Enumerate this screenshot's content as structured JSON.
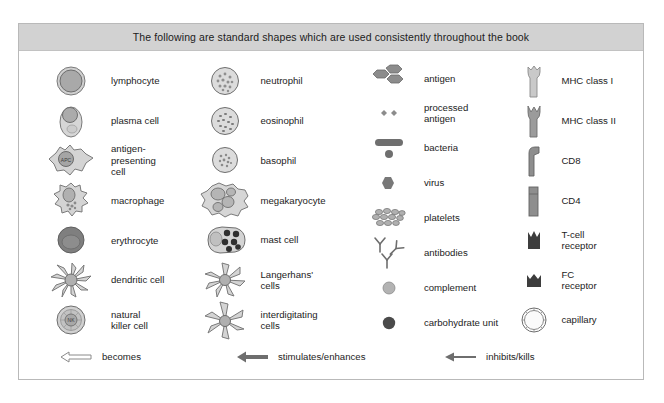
{
  "figure": {
    "header_title": "The following are standard shapes which are used consistently throughout the book",
    "colors": {
      "header_band": "#d2d2d2",
      "border": "#b9b9b9",
      "cell_fill_light": "#d8d8d8",
      "cell_fill_mid": "#b5b5b5",
      "cell_fill_dark": "#7d7d7d",
      "cell_fill_darkest": "#4a4a4a",
      "outline": "#6e6e6e",
      "text": "#1c1c1c"
    }
  },
  "columns": [
    {
      "id": "column-cells-1",
      "items": [
        {
          "icon": "lymphocyte-icon",
          "label": "lymphocyte"
        },
        {
          "icon": "plasma-cell-icon",
          "label": "plasma cell"
        },
        {
          "icon": "antigen-presenting-cell-icon",
          "label": "antigen-\npresenting\ncell",
          "inner_text": "APC"
        },
        {
          "icon": "macrophage-icon",
          "label": "macrophage"
        },
        {
          "icon": "erythrocyte-icon",
          "label": "erythrocyte"
        },
        {
          "icon": "dendritic-cell-icon",
          "label": "dendritic cell"
        },
        {
          "icon": "natural-killer-cell-icon",
          "label": "natural\nkiller cell",
          "inner_text": "NK"
        }
      ]
    },
    {
      "id": "column-cells-2",
      "items": [
        {
          "icon": "neutrophil-icon",
          "label": "neutrophil"
        },
        {
          "icon": "eosinophil-icon",
          "label": "eosinophil"
        },
        {
          "icon": "basophil-icon",
          "label": "basophil"
        },
        {
          "icon": "megakaryocyte-icon",
          "label": "megakaryocyte"
        },
        {
          "icon": "mast-cell-icon",
          "label": "mast cell"
        },
        {
          "icon": "langerhans-cells-icon",
          "label": "Langerhans'\ncells"
        },
        {
          "icon": "interdigitating-cells-icon",
          "label": "interdigitating\ncells"
        }
      ]
    },
    {
      "id": "column-particles-3",
      "items": [
        {
          "icon": "antigen-icon",
          "label": "antigen"
        },
        {
          "icon": "processed-antigen-icon",
          "label": "processed\nantigen"
        },
        {
          "icon": "bacteria-icon",
          "label": "bacteria"
        },
        {
          "icon": "virus-icon",
          "label": "virus"
        },
        {
          "icon": "platelets-icon",
          "label": "platelets"
        },
        {
          "icon": "antibodies-icon",
          "label": "antibodies"
        },
        {
          "icon": "complement-icon",
          "label": "complement"
        },
        {
          "icon": "carbohydrate-unit-icon",
          "label": "carbohydrate unit"
        }
      ]
    },
    {
      "id": "column-molecules-4",
      "items": [
        {
          "icon": "mhc-class-i-icon",
          "label": "MHC class I"
        },
        {
          "icon": "mhc-class-ii-icon",
          "label": "MHC class II"
        },
        {
          "icon": "cd8-icon",
          "label": "CD8"
        },
        {
          "icon": "cd4-icon",
          "label": "CD4"
        },
        {
          "icon": "t-cell-receptor-icon",
          "label": "T-cell\nreceptor"
        },
        {
          "icon": "fc-receptor-icon",
          "label": "FC\nreceptor"
        },
        {
          "icon": "capillary-icon",
          "label": "capillary"
        }
      ]
    }
  ],
  "arrows": [
    {
      "icon": "becomes-arrow-icon",
      "label": "becomes",
      "style": "hollow"
    },
    {
      "icon": "stimulates-arrow-icon",
      "label": "stimulates/enhances",
      "style": "solid-thick"
    },
    {
      "icon": "inhibits-arrow-icon",
      "label": "inhibits/kills",
      "style": "solid-thin"
    }
  ]
}
